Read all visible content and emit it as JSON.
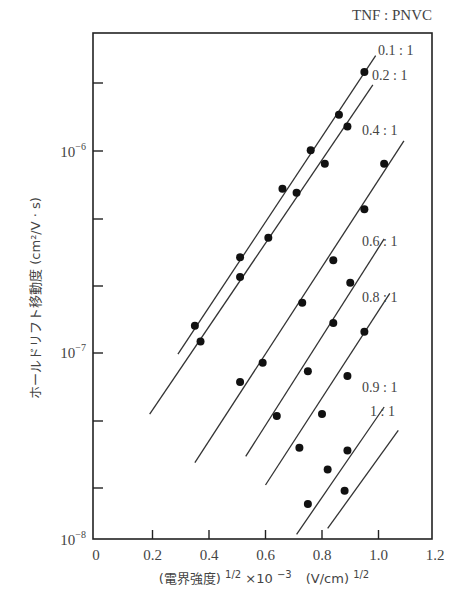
{
  "chart_data": {
    "type": "scatter",
    "title": "TNF : PNVC",
    "xlabel": "(電界強度)^1/2×10^-3 (V/cm)^1/2",
    "ylabel": "ホールドリフト移動度 (cm²/V·s)",
    "xlim": [
      0,
      1.2
    ],
    "ylim": [
      1e-08,
      4.5e-06
    ],
    "yscale": "log",
    "grid": false,
    "x_ticks": [
      "0",
      "0.2",
      "0.4",
      "0.6",
      "0.8",
      "1.0",
      "1.2"
    ],
    "y_ticks": [
      {
        "base": "10",
        "exp": "−6",
        "value": 1e-06
      },
      {
        "base": "10",
        "exp": "−7",
        "value": 1e-07
      },
      {
        "base": "10",
        "exp": "−8",
        "value": 1e-08
      }
    ],
    "series": [
      {
        "name": "0.1 : 1",
        "label": "0.1 : 1",
        "x": [
          0.35,
          0.51,
          0.66,
          0.76,
          0.86,
          0.95
        ],
        "values": [
          1.3e-07,
          2.9e-07,
          6.5e-07,
          1.02e-06,
          1.55e-06,
          2.56e-06
        ],
        "line": [
          [
            0.29,
            9.3e-08
          ],
          [
            0.99,
            3.1e-06
          ]
        ]
      },
      {
        "name": "0.2 : 1",
        "label": "0.2 : 1",
        "x": [
          0.37,
          0.51,
          0.61,
          0.71,
          0.81,
          0.89
        ],
        "values": [
          1.08e-07,
          2.3e-07,
          3.65e-07,
          6.2e-07,
          8.7e-07,
          1.35e-06
        ],
        "line": [
          [
            0.19,
            4.6e-08
          ],
          [
            0.98,
            2.2e-06
          ]
        ]
      },
      {
        "name": "0.4 : 1",
        "label": "0.4 : 1",
        "x": [
          0.51,
          0.59,
          0.73,
          0.84,
          0.95,
          1.02
        ],
        "values": [
          6.7e-08,
          8.4e-08,
          1.7e-07,
          2.8e-07,
          5.1e-07,
          8.7e-07
        ],
        "line": [
          [
            0.35,
            2.6e-08
          ],
          [
            1.09,
            1.14e-06
          ]
        ]
      },
      {
        "name": "0.6 : 1",
        "label": "0.6 : 1",
        "x": [
          0.64,
          0.75,
          0.84,
          0.9
        ],
        "values": [
          4.5e-08,
          7.6e-08,
          1.34e-07,
          2.15e-07
        ],
        "line": [
          [
            0.53,
            2.8e-08
          ],
          [
            1.02,
            3.6e-07
          ]
        ]
      },
      {
        "name": "0.8 : 1",
        "label": "0.8 : 1",
        "x": [
          0.72,
          0.8,
          0.89,
          0.95
        ],
        "values": [
          3.1e-08,
          4.6e-08,
          7.2e-08,
          1.21e-07
        ],
        "line": [
          [
            0.6,
            2e-08
          ],
          [
            1.04,
            1.9e-07
          ]
        ]
      },
      {
        "name": "0.9 : 1",
        "label": "0.9 : 1",
        "x": [
          0.75,
          0.82,
          0.89
        ],
        "values": [
          1.6e-08,
          2.4e-08,
          3e-08
        ],
        "line": [
          [
            0.71,
            1.12e-08
          ],
          [
            1.02,
            5e-08
          ]
        ]
      },
      {
        "name": "1 : 1",
        "label": "1 : 1",
        "x": [
          0.88
        ],
        "values": [
          1.87e-08
        ],
        "line": [
          [
            0.82,
            1.2e-08
          ],
          [
            1.07,
            3.8e-08
          ]
        ]
      }
    ]
  },
  "labels": {
    "title": "TNF : PNVC",
    "xlabel_main": "(電界強度)",
    "xlabel_exp1": "1/2",
    "xlabel_mult": "×10",
    "xlabel_exp2": "−3",
    "xlabel_unit": "(V/cm)",
    "xlabel_exp3": "1/2",
    "ylabel": "ホールドリフト移動度 (cm²/V · s)"
  }
}
